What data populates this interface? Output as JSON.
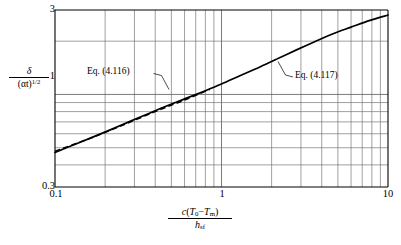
{
  "chart_data": {
    "type": "line",
    "title": "",
    "subtitle": "",
    "xlabel": "c(T0 - Tm) / hsf",
    "ylabel": "delta / (alpha t)^(1/2)",
    "xscale": "log",
    "yscale": "log",
    "xlim": [
      0.1,
      10
    ],
    "ylim": [
      0.3,
      3
    ],
    "grid": true,
    "legend_position": "inline-annotations",
    "x_tick_labels": [
      "0.1",
      "1",
      "10"
    ],
    "x_tick_values": [
      0.1,
      1,
      10
    ],
    "y_tick_labels": [
      "0.3",
      "1",
      "3"
    ],
    "y_tick_values": [
      0.3,
      1,
      3
    ],
    "series": [
      {
        "name": "Eq. (4.117)",
        "style": "solid",
        "annotation": "Eq. (4.117)",
        "x": [
          0.1,
          0.13,
          0.17,
          0.22,
          0.28,
          0.36,
          0.46,
          0.6,
          0.78,
          1.0,
          1.3,
          1.7,
          2.2,
          2.8,
          3.6,
          4.6,
          6.0,
          7.8,
          10.0
        ],
        "y": [
          0.47,
          0.52,
          0.576,
          0.637,
          0.702,
          0.776,
          0.855,
          0.944,
          1.04,
          1.145,
          1.28,
          1.43,
          1.6,
          1.78,
          1.98,
          2.19,
          2.4,
          2.62,
          2.81
        ]
      },
      {
        "name": "Eq. (4.116)",
        "style": "dashed",
        "annotation": "Eq. (4.116)",
        "x": [
          0.1,
          0.16,
          0.25,
          0.4,
          0.6,
          0.85
        ],
        "y": [
          0.478,
          0.562,
          0.665,
          0.8,
          0.93,
          1.068
        ]
      }
    ],
    "annotations": [
      {
        "text": "Eq. (4.116)",
        "target_series": "Eq. (4.116)",
        "side": "left"
      },
      {
        "text": "Eq. (4.117)",
        "target_series": "Eq. (4.117)",
        "side": "right"
      }
    ]
  },
  "axes": {
    "y_top_label": "3",
    "y_mid_label": "1",
    "y_bottom_label": "0.3",
    "x_left_label": "0.1",
    "x_mid_label": "1",
    "x_right_label": "10",
    "y_axis_numerator": "δ",
    "y_axis_denominator_base": "(αt)",
    "y_axis_denominator_exp": "1/2",
    "x_axis_numerator_parts": {
      "c": "c",
      "open": "(",
      "T0": "T",
      "T0_sub": "0",
      "minus": "−",
      "Tm": "T",
      "Tm_sub": "m",
      "close": ")"
    },
    "x_axis_denominator": "h",
    "x_axis_denominator_sub": "sf"
  },
  "annotations": {
    "eq_left": "Eq. (4.116)",
    "eq_right": "Eq. (4.117)"
  },
  "colors": {
    "curve": "#000000",
    "grid_major": "#5a5a5a",
    "grid_minor": "#6e6e6e",
    "axis": "#000000",
    "background": "#ffffff"
  }
}
